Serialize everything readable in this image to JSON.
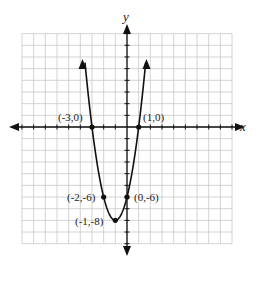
{
  "chart_data": {
    "type": "line",
    "title": "",
    "xlabel": "x",
    "ylabel": "y",
    "xlim": [
      -9,
      9
    ],
    "ylim": [
      -10,
      8
    ],
    "grid": true,
    "function": "y = 2x^2 + 4x - 6",
    "series": [
      {
        "name": "parabola",
        "x": [
          -3.6,
          -3,
          -2,
          -1,
          0,
          1,
          1.6
        ],
        "y": [
          5.5,
          0,
          -6,
          -8,
          -6,
          0,
          5.5
        ]
      }
    ],
    "points": [
      {
        "x": -3,
        "y": 0,
        "label": "(-3,0)"
      },
      {
        "x": 1,
        "y": 0,
        "label": "(1,0)"
      },
      {
        "x": -2,
        "y": -6,
        "label": "(-2,-6)"
      },
      {
        "x": 0,
        "y": -6,
        "label": "(0,-6)"
      },
      {
        "x": -1,
        "y": -8,
        "label": "(-1,-8)"
      }
    ]
  },
  "labels": {
    "x_axis": "x",
    "y_axis": "y",
    "p1": "(-3,0)",
    "p2": "(1,0)",
    "p3": "(-2,-6)",
    "p4": "(0,-6)",
    "p5": "(-1,-8)"
  }
}
